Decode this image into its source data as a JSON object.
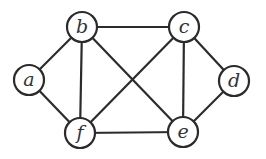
{
  "graph": {
    "node_radius": 15,
    "stroke_color": "#2b2b2b",
    "nodes": [
      {
        "id": "a",
        "label": "a",
        "x": 29,
        "y": 80
      },
      {
        "id": "b",
        "label": "b",
        "x": 82,
        "y": 27
      },
      {
        "id": "c",
        "label": "c",
        "x": 184,
        "y": 27
      },
      {
        "id": "d",
        "label": "d",
        "x": 234,
        "y": 81
      },
      {
        "id": "e",
        "label": "e",
        "x": 183,
        "y": 132
      },
      {
        "id": "f",
        "label": "f",
        "x": 80,
        "y": 133
      }
    ],
    "edges": [
      [
        "a",
        "b"
      ],
      [
        "a",
        "f"
      ],
      [
        "b",
        "c"
      ],
      [
        "b",
        "f"
      ],
      [
        "b",
        "e"
      ],
      [
        "c",
        "f"
      ],
      [
        "c",
        "e"
      ],
      [
        "c",
        "d"
      ],
      [
        "d",
        "e"
      ],
      [
        "f",
        "e"
      ]
    ]
  }
}
